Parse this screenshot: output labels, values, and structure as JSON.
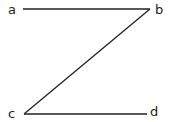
{
  "diagram": {
    "points": [
      {
        "id": "a",
        "label": "a"
      },
      {
        "id": "b",
        "label": "b"
      },
      {
        "id": "c",
        "label": "c"
      },
      {
        "id": "d",
        "label": "d"
      }
    ],
    "segments": [
      {
        "from": "a",
        "to": "b"
      },
      {
        "from": "b",
        "to": "c"
      },
      {
        "from": "c",
        "to": "d"
      }
    ],
    "colors": {
      "stroke": "#222222",
      "background": "#ffffff"
    }
  }
}
